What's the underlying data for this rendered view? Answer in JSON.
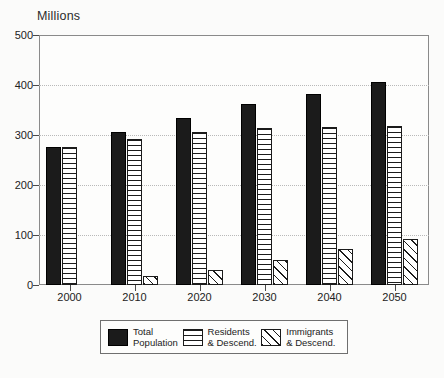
{
  "chart_data": {
    "type": "bar",
    "title": "",
    "unit_label": "Millions",
    "xlabel": "",
    "ylabel": "Millions",
    "categories": [
      "2000",
      "2010",
      "2020",
      "2030",
      "2040",
      "2050"
    ],
    "series": [
      {
        "name": "Total Population",
        "values": [
          276,
          306,
          334,
          362,
          382,
          406
        ],
        "fill": "solid-black"
      },
      {
        "name": "Residents & Descend.",
        "values": [
          276,
          292,
          306,
          314,
          316,
          318
        ],
        "fill": "horizontal-stripes"
      },
      {
        "name": "Immigrants & Descend.",
        "values": [
          0,
          18,
          30,
          50,
          72,
          92
        ],
        "fill": "diagonal-hatch"
      }
    ],
    "ylim": [
      0,
      500
    ],
    "yticks": [
      0,
      100,
      200,
      300,
      400,
      500
    ],
    "ytick_labels": [
      "0",
      "100",
      "200",
      "300",
      "400",
      "500"
    ],
    "grid": true,
    "grid_style": "dotted-horizontal",
    "legend_position": "bottom-center"
  },
  "legend": {
    "items": [
      {
        "label": "Total\nPopulation",
        "swatch": "solid-black-swatch"
      },
      {
        "label": "Residents\n& Descend.",
        "swatch": "horizontal-stripes-swatch"
      },
      {
        "label": "Immigrants\n& Descend.",
        "swatch": "diagonal-hatch-swatch"
      }
    ]
  },
  "colors": {
    "series_total": "#1b1b1b",
    "outline": "#1b1b1b",
    "frame": "#8a8a8a",
    "gridline": "#b9b9b9",
    "background": "#fbfbfa",
    "plot_background": "#fdfdfc",
    "text": "#222222"
  }
}
